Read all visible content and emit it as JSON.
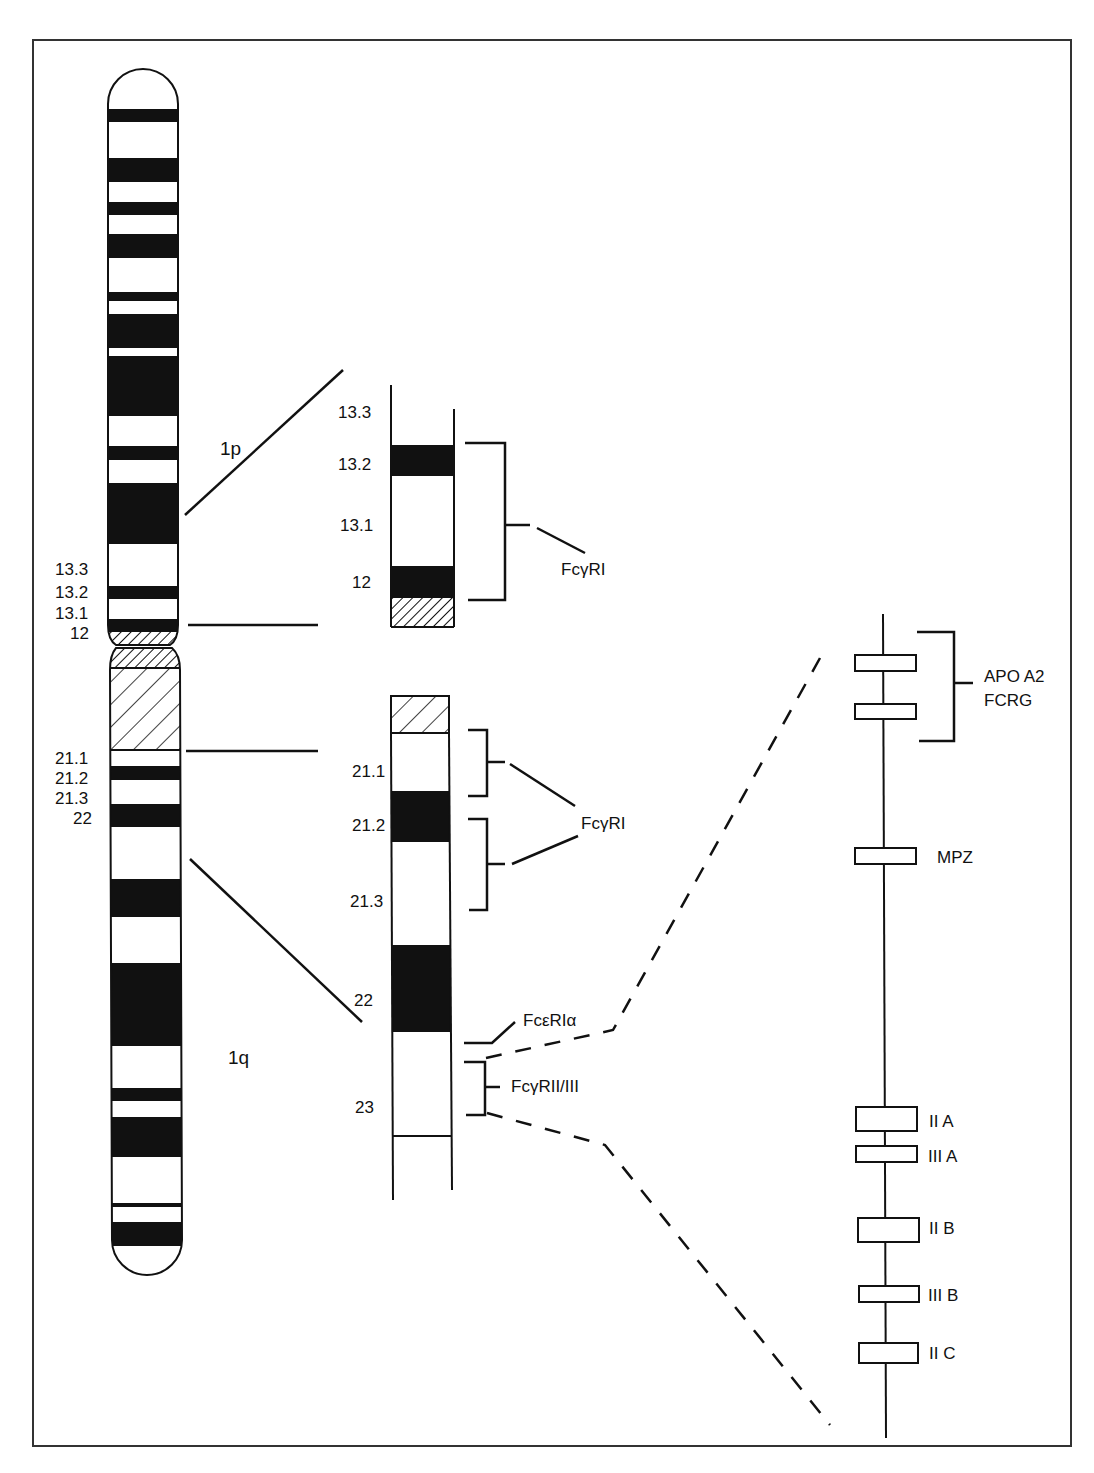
{
  "figure": {
    "colors": {
      "ink": "#111111",
      "paper": "#ffffff",
      "border": "#333333"
    }
  },
  "ideogram": {
    "arm_labels": {
      "p": "1p",
      "q": "1q"
    },
    "p_band_labels": [
      "13.3",
      "13.2",
      "13.1",
      "12"
    ],
    "q_band_labels": [
      "21.1",
      "21.2",
      "21.3",
      "22"
    ]
  },
  "p_expansion": {
    "band_labels": [
      "13.3",
      "13.2",
      "13.1",
      "12"
    ],
    "gene_label": "FcγRI"
  },
  "q_expansion": {
    "band_labels": [
      "21.1",
      "21.2",
      "21.3",
      "22",
      "23"
    ],
    "gene_label_fcgri": "FcγRI",
    "gene_label_fcerI": "FcεRIα",
    "gene_label_fcgrii": "FcγRII/III"
  },
  "gene_map": {
    "cluster_label_line1": "APO A2",
    "cluster_label_line2": "FCRG",
    "genes": [
      "MPZ",
      "II A",
      "III A",
      "II B",
      "III B",
      "II C"
    ]
  }
}
